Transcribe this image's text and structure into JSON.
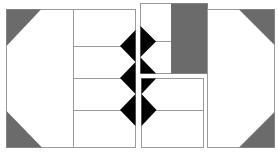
{
  "diagram": {
    "colors": {
      "background": "#ffffff",
      "border": "#9a9a9a",
      "gray_fill": "#6b6b6b",
      "black_fill": "#000000"
    },
    "panels": [
      {
        "id": "left-panel",
        "x": 6,
        "y": 9,
        "w": 129,
        "h": 138,
        "divider_x": 73,
        "rows_y": [
          46,
          78,
          110
        ]
      },
      {
        "id": "middle-top-panel",
        "x": 140,
        "y": 3,
        "w": 67,
        "h": 70,
        "row_y": 41,
        "gray_block_x": 171
      },
      {
        "id": "middle-bottom-panel",
        "x": 141,
        "y": 78,
        "w": 62,
        "h": 69,
        "row_y": 110
      },
      {
        "id": "right-panel",
        "x": 207,
        "y": 9,
        "w": 67,
        "h": 138
      }
    ]
  }
}
